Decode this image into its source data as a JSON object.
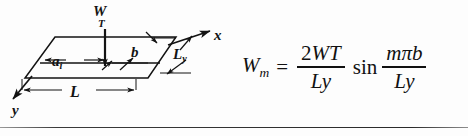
{
  "figure": {
    "kind": "engineering-diagram-with-equation",
    "ink_color": "#131313",
    "background_color": "#fdfdfd"
  },
  "diagram": {
    "name": "skewed-plate-load-diagram",
    "shape": "parallelogram-plate",
    "axes": [
      {
        "id": "x",
        "label": "x",
        "direction": "right"
      },
      {
        "id": "y",
        "label": "y",
        "direction": "down-left"
      }
    ],
    "load": {
      "symbol": "W",
      "subscript": "T",
      "direction": "downward",
      "description": "concentrated line load arrow"
    },
    "dimensions": [
      {
        "id": "a_i",
        "symbol": "a",
        "subscript": "i",
        "orientation": "horizontal"
      },
      {
        "id": "b",
        "symbol": "b",
        "subscript": "",
        "orientation": "horizontal"
      },
      {
        "id": "L",
        "symbol": "L",
        "subscript": "",
        "orientation": "horizontal"
      },
      {
        "id": "L_y",
        "symbol": "L",
        "subscript": "y",
        "orientation": "slanted-edge"
      }
    ]
  },
  "equation": {
    "name": "fourier-load-coefficient",
    "lhs": {
      "symbol": "W",
      "subscript": "m"
    },
    "relation": "=",
    "fraction1": {
      "numerator_coefficient": "2",
      "numerator_symbol": "W",
      "numerator_subscript": "T",
      "denominator_symbol": "L",
      "denominator_subscript": "y"
    },
    "function": "sin",
    "fraction2": {
      "numerator": "mπb",
      "denominator_symbol": "L",
      "denominator_subscript": "y"
    },
    "plain_text": "W_m = (2 W_T / L_y) sin( mπb / L_y )"
  }
}
